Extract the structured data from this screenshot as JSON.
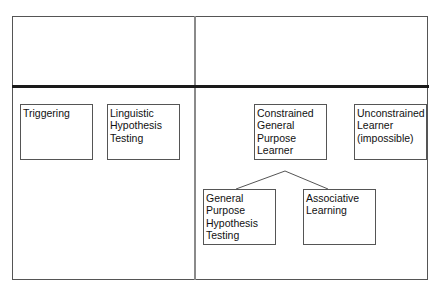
{
  "diagram": {
    "top_left_cell": "",
    "top_right_cell": "",
    "boxes": [
      {
        "id": "triggering",
        "label": "Triggering"
      },
      {
        "id": "linguistic-hypothesis-testing",
        "label": "Linguistic Hypothesis Testing"
      },
      {
        "id": "constrained-general-purpose-learner",
        "label": "Constrained General Purpose Learner"
      },
      {
        "id": "unconstrained-learner",
        "label": "Unconstrained Learner (impossible)"
      },
      {
        "id": "general-purpose-hypothesis-testing",
        "label": "General Purpose Hypothesis Testing"
      },
      {
        "id": "associative-learning",
        "label": "Associative Learning"
      }
    ],
    "edges": [
      {
        "from": "constrained-general-purpose-learner",
        "to": "general-purpose-hypothesis-testing"
      },
      {
        "from": "constrained-general-purpose-learner",
        "to": "associative-learning"
      }
    ],
    "colors": {
      "frame": "#555555",
      "vertical_divider": "#8a8a8a",
      "horizontal_divider": "#1a1a1a",
      "box_border": "#555555",
      "text": "#111111"
    }
  }
}
